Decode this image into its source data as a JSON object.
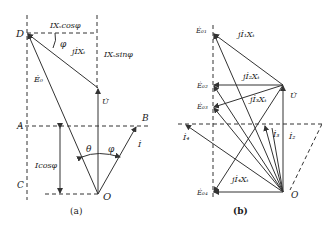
{
  "figure_a": {
    "caption": "(a)",
    "points": {
      "D": "D",
      "A": "A",
      "B": "B",
      "C": "C",
      "O": "O"
    },
    "labels": {
      "ixs_cos": "IXₛcosφ",
      "ixs_sin": "IXₛsinφ",
      "jixs": "jİXₜ",
      "e0": "Ė₀",
      "u": "U̇",
      "i": "İ",
      "icos": "Icosφ",
      "phi_top": "φ",
      "theta": "θ",
      "phi_bottom": "φ"
    }
  },
  "figure_b": {
    "caption": "(b)",
    "labels": {
      "e01": "Ė₀₁",
      "e02": "Ė₀₂",
      "e03": "Ė₀₃",
      "e04": "Ė₀₄",
      "j1x": "jİ₁Xₜ",
      "j2x": "jİ₂Xₜ",
      "j3x": "jİ₃Xₜ",
      "j4x": "jİ₄Xₜ",
      "u": "U̇",
      "i2": "İ₂",
      "i3": "İ₃",
      "i4": "İ₄",
      "o": "O"
    }
  }
}
